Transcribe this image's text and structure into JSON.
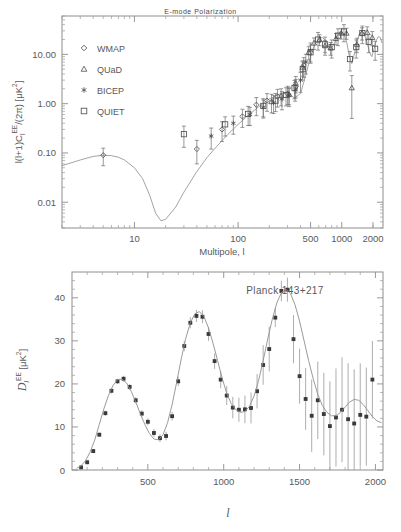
{
  "figure": {
    "title_faded": "E-mode Polarization",
    "width": 401,
    "height": 532,
    "background": "#ffffff",
    "ink_color": "#595959"
  },
  "panel_top": {
    "ylabel": "l(l+1)Cₗᴱᴱ/(2π)  [μK²]",
    "ylabel_parts": {
      "pre": "l(l+1)C",
      "sub": "l",
      "sup": "EE",
      "mid": "/(2π)  [",
      "unit": "μK",
      "unit_sup": "2",
      "post": "]"
    },
    "xlabel": "Multipole, l",
    "x_ticks": [
      "10",
      "100",
      "500",
      "1000",
      "2000"
    ],
    "x_tick_values": [
      10,
      100,
      500,
      1000,
      2000
    ],
    "y_ticks": [
      "10.00",
      "1.00",
      "0.10",
      "0.01"
    ],
    "y_tick_values": [
      10.0,
      1.0,
      0.1,
      0.01
    ],
    "xlim": [
      2,
      2500
    ],
    "ylim": [
      0.003,
      60
    ],
    "xscale": "log",
    "yscale": "log",
    "legend": [
      {
        "label": "WMAP",
        "marker": "diamond"
      },
      {
        "label": "QUaD",
        "marker": "triangle"
      },
      {
        "label": "BICEP",
        "marker": "asterisk"
      },
      {
        "label": "QUIET",
        "marker": "square"
      }
    ]
  },
  "panel_bottom": {
    "ylabel_parts": {
      "script": "D",
      "sub": "l",
      "sup": "EE",
      "unit_open": "  [",
      "unit": "μK",
      "unit_sup": "2",
      "unit_close": "]"
    },
    "xlabel": "l",
    "annotation": "Planck 143+217",
    "x_ticks": [
      "500",
      "1000",
      "1500",
      "2000"
    ],
    "x_tick_values": [
      500,
      1000,
      1500,
      2000
    ],
    "y_ticks": [
      "0",
      "10",
      "20",
      "30",
      "40"
    ],
    "y_tick_values": [
      0,
      10,
      20,
      30,
      40
    ],
    "xlim": [
      0,
      2050
    ],
    "ylim": [
      0,
      46
    ],
    "xscale": "linear",
    "yscale": "linear"
  },
  "chart_data": [
    {
      "type": "scatter",
      "id": "top-panel-ee-compilation",
      "title": "",
      "xlabel": "Multipole, l",
      "ylabel": "l(l+1)C_l^EE/(2pi) [uK^2]",
      "xscale": "log",
      "yscale": "log",
      "xlim": [
        2,
        2500
      ],
      "ylim": [
        0.003,
        60
      ],
      "grid": false,
      "legend_position": "upper-left",
      "series": [
        {
          "name": "Theory LCDM EE",
          "type": "line",
          "x": [
            2,
            3,
            4,
            5,
            6,
            7,
            8,
            10,
            12,
            14,
            16,
            18,
            20,
            25,
            30,
            40,
            50,
            60,
            80,
            100,
            130,
            160,
            200,
            250,
            300,
            350,
            400,
            450,
            500,
            550,
            600,
            650,
            700,
            750,
            800,
            850,
            900,
            950,
            1000,
            1060,
            1120,
            1180,
            1250,
            1320,
            1400,
            1480,
            1560,
            1650,
            1750,
            1850,
            1950,
            2050,
            2150,
            2250,
            2350,
            2450
          ],
          "y": [
            0.055,
            0.072,
            0.085,
            0.09,
            0.088,
            0.082,
            0.072,
            0.05,
            0.03,
            0.014,
            0.006,
            0.0042,
            0.0045,
            0.008,
            0.016,
            0.042,
            0.08,
            0.125,
            0.24,
            0.38,
            0.62,
            0.88,
            1.25,
            1.55,
            1.65,
            1.3,
            1.6,
            3.8,
            9.0,
            16.0,
            21.0,
            22.0,
            19.0,
            14.0,
            13.5,
            17.0,
            23.0,
            28.0,
            29.0,
            25.0,
            17.0,
            9.5,
            6.5,
            10.0,
            18.0,
            26.0,
            29.0,
            26.0,
            18.0,
            11.0,
            9.0,
            13.0,
            19.0,
            23.0,
            22.0,
            17.0
          ]
        },
        {
          "name": "WMAP",
          "marker": "diamond",
          "x": [
            5,
            40,
            70,
            110,
            150,
            190,
            240,
            300,
            360,
            430
          ],
          "y": [
            0.09,
            0.12,
            0.3,
            0.55,
            0.95,
            1.15,
            1.4,
            1.6,
            2.2,
            6.0
          ],
          "yerr_lo": [
            0.035,
            0.06,
            0.13,
            0.22,
            0.38,
            0.45,
            0.55,
            0.65,
            0.9,
            2.6
          ],
          "yerr_hi": [
            0.035,
            0.06,
            0.13,
            0.22,
            0.38,
            0.45,
            0.55,
            0.65,
            0.9,
            2.6
          ]
        },
        {
          "name": "QUaD",
          "marker": "triangle",
          "x": [
            210,
            260,
            310,
            360,
            420,
            480,
            540,
            610,
            690,
            780,
            880,
            990,
            1110,
            1250,
            1400,
            1570,
            1760,
            1970
          ],
          "y": [
            1.1,
            1.45,
            1.55,
            2.6,
            5.5,
            11.0,
            17.0,
            20.0,
            15.0,
            13.5,
            21.0,
            27.0,
            27.0,
            2.1,
            16.0,
            27.0,
            28.0,
            22.0
          ],
          "yerr_lo": [
            0.45,
            0.55,
            0.6,
            0.95,
            1.9,
            3.3,
            4.5,
            5.0,
            4.2,
            3.9,
            5.4,
            6.6,
            6.8,
            1.6,
            5.2,
            7.5,
            8.2,
            7.0
          ],
          "yerr_hi": [
            0.45,
            0.55,
            0.6,
            0.95,
            1.9,
            3.3,
            4.5,
            5.0,
            4.2,
            3.9,
            5.4,
            6.6,
            6.8,
            1.6,
            5.2,
            7.5,
            8.2,
            7.0
          ]
        },
        {
          "name": "BICEP",
          "marker": "asterisk",
          "x": [
            55,
            90,
            130,
            175,
            220,
            265,
            310,
            355,
            400,
            450,
            500
          ],
          "y": [
            0.22,
            0.4,
            0.6,
            0.85,
            1.05,
            1.25,
            1.45,
            1.9,
            3.0,
            7.0,
            12.0
          ],
          "yerr_lo": [
            0.1,
            0.16,
            0.24,
            0.34,
            0.42,
            0.5,
            0.58,
            0.78,
            1.3,
            3.0,
            5.0
          ],
          "yerr_hi": [
            0.1,
            0.16,
            0.24,
            0.34,
            0.42,
            0.5,
            0.58,
            0.78,
            1.3,
            3.0,
            5.0
          ]
        },
        {
          "name": "QUIET",
          "marker": "square",
          "x": [
            30,
            75,
            125,
            175,
            230,
            290,
            350,
            420,
            500,
            590,
            690,
            800,
            920,
            1050,
            1200,
            1380,
            1580,
            1820,
            2100
          ],
          "y": [
            0.24,
            0.38,
            0.62,
            0.9,
            1.15,
            1.5,
            2.1,
            5.0,
            11.0,
            20.0,
            16.0,
            14.0,
            24.0,
            29.0,
            8.0,
            14.0,
            27.0,
            18.0,
            13.0
          ],
          "yerr_lo": [
            0.11,
            0.16,
            0.26,
            0.36,
            0.46,
            0.6,
            0.85,
            2.0,
            4.4,
            7.8,
            6.4,
            5.6,
            9.0,
            11.0,
            3.4,
            5.6,
            10.5,
            7.2,
            5.4
          ],
          "yerr_hi": [
            0.11,
            0.16,
            0.26,
            0.36,
            0.46,
            0.6,
            0.85,
            2.0,
            4.4,
            7.8,
            6.4,
            5.6,
            9.0,
            11.0,
            3.4,
            5.6,
            10.5,
            7.2,
            5.4
          ]
        }
      ]
    },
    {
      "type": "scatter",
      "id": "bottom-panel-planck-ee",
      "title": "Planck 143+217",
      "xlabel": "l",
      "ylabel": "D_l^EE [uK^2]",
      "xscale": "linear",
      "yscale": "linear",
      "xlim": [
        0,
        2050
      ],
      "ylim": [
        0,
        46
      ],
      "grid": false,
      "series": [
        {
          "name": "Best-fit LCDM EE",
          "type": "line",
          "x": [
            30,
            60,
            90,
            120,
            150,
            180,
            210,
            240,
            270,
            300,
            330,
            360,
            390,
            420,
            450,
            480,
            510,
            540,
            570,
            600,
            630,
            660,
            690,
            720,
            750,
            780,
            810,
            840,
            870,
            900,
            930,
            960,
            990,
            1020,
            1050,
            1080,
            1110,
            1140,
            1170,
            1200,
            1230,
            1260,
            1290,
            1320,
            1350,
            1380,
            1410,
            1440,
            1470,
            1500,
            1530,
            1560,
            1590,
            1620,
            1650,
            1680,
            1710,
            1740,
            1770,
            1800,
            1830,
            1860,
            1890,
            1920,
            1950,
            1980,
            2010,
            2040
          ],
          "y": [
            0.4,
            1.0,
            2.2,
            4.2,
            7.0,
            10.6,
            14.2,
            17.3,
            19.6,
            21.0,
            21.1,
            20.2,
            18.3,
            15.8,
            13.1,
            10.6,
            8.5,
            7.2,
            7.0,
            8.2,
            11.0,
            15.2,
            20.4,
            25.8,
            30.6,
            34.2,
            36.3,
            36.8,
            35.6,
            33.0,
            29.4,
            25.4,
            21.3,
            17.8,
            15.4,
            14.0,
            13.4,
            13.6,
            14.8,
            17.2,
            20.8,
            25.4,
            30.4,
            35.0,
            38.8,
            41.2,
            42.0,
            41.0,
            38.4,
            34.6,
            30.0,
            25.4,
            21.2,
            17.6,
            15.0,
            13.4,
            12.6,
            12.6,
            13.4,
            14.6,
            15.8,
            16.4,
            16.2,
            15.2,
            13.8,
            12.4,
            11.4,
            11.0
          ]
        },
        {
          "name": "Planck 143+217 EE",
          "marker": "square-filled",
          "x": [
            60,
            100,
            140,
            180,
            220,
            260,
            300,
            340,
            380,
            420,
            460,
            500,
            540,
            580,
            620,
            660,
            700,
            740,
            780,
            820,
            860,
            900,
            940,
            980,
            1020,
            1060,
            1100,
            1140,
            1180,
            1220,
            1260,
            1300,
            1340,
            1380,
            1420,
            1460,
            1500,
            1540,
            1580,
            1620,
            1660,
            1700,
            1740,
            1780,
            1820,
            1860,
            1900,
            1940,
            1980
          ],
          "y": [
            0.6,
            1.8,
            4.4,
            8.2,
            13.2,
            18.4,
            20.6,
            21.2,
            19.3,
            16.2,
            13.1,
            11.2,
            8.6,
            7.4,
            7.9,
            12.5,
            20.6,
            28.8,
            34.2,
            35.8,
            35.6,
            31.6,
            25.3,
            21.0,
            17.3,
            14.5,
            14.0,
            14.1,
            14.4,
            18.3,
            24.4,
            28.1,
            35.4,
            41.6,
            41.9,
            30.4,
            21.8,
            16.5,
            12.6,
            16.2,
            13.0,
            10.2,
            12.2,
            14.0,
            11.8,
            10.8,
            12.8,
            12.4,
            21.0
          ],
          "yerr_lo": [
            0.5,
            0.5,
            0.5,
            0.5,
            0.6,
            0.6,
            0.6,
            0.7,
            0.7,
            0.7,
            0.8,
            0.8,
            0.9,
            0.9,
            1.0,
            1.0,
            1.1,
            1.2,
            1.3,
            1.4,
            1.5,
            1.6,
            1.8,
            2.0,
            2.2,
            2.5,
            2.8,
            3.2,
            3.6,
            4.0,
            4.6,
            5.2,
            2.2,
            2.4,
            2.8,
            5.6,
            6.4,
            7.2,
            8.4,
            9.0,
            9.6,
            10.4,
            11.4,
            12.2,
            13.0,
            12.6,
            12.0,
            11.4,
            9.0
          ],
          "yerr_hi": [
            0.5,
            0.5,
            0.5,
            0.5,
            0.6,
            0.6,
            0.6,
            0.7,
            0.7,
            0.7,
            0.8,
            0.8,
            0.9,
            0.9,
            1.0,
            1.0,
            1.1,
            1.2,
            1.3,
            1.4,
            1.5,
            1.6,
            1.8,
            2.0,
            2.2,
            2.5,
            2.8,
            3.2,
            3.6,
            4.0,
            4.6,
            5.2,
            2.2,
            2.4,
            2.8,
            5.6,
            6.4,
            7.2,
            8.4,
            9.0,
            9.6,
            10.4,
            11.4,
            12.2,
            13.0,
            12.6,
            12.0,
            11.4,
            9.0
          ]
        }
      ]
    }
  ]
}
